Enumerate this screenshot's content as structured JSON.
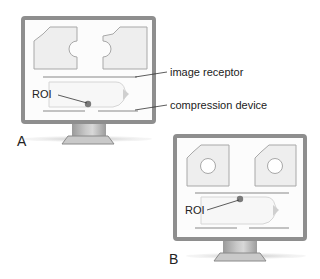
{
  "panels": [
    {
      "id": "A",
      "letter": "A",
      "roi_label": "ROI",
      "roi_position": "lower, near compression device",
      "cutout_shape": "half-circle notch on right edge of each projection"
    },
    {
      "id": "B",
      "letter": "B",
      "roi_label": "ROI",
      "roi_position": "upper, near image receptor",
      "cutout_shape": "full circle centered in each projection"
    }
  ],
  "callouts": {
    "image_receptor": "image receptor",
    "compression_device": "compression device"
  },
  "colors": {
    "frame": "#8e8e8e",
    "projection_fill": "#eeeeee",
    "projection_stroke": "#a8a8a8",
    "roi_dot": "#7a7a7a",
    "plate": "#c4c4c4"
  }
}
